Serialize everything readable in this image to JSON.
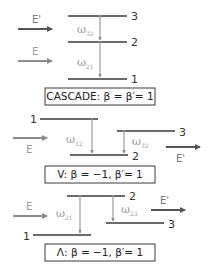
{
  "colors": {
    "level_line": "#3a3a3a",
    "beam_dark": "#555555",
    "beam_light": "#8c8c8c",
    "transition": "#8a8a8a",
    "label_gray": "#9a9a9a",
    "text": "#222222"
  },
  "diagrams": [
    {
      "name": "cascade",
      "levels": [
        "3",
        "2",
        "1"
      ],
      "fields": {
        "e_prime": "E'",
        "e": "E"
      },
      "transitions": [
        {
          "symbol": "ω",
          "subscript": "32"
        },
        {
          "symbol": "ω",
          "subscript": "21"
        }
      ],
      "caption": "CASCADE: β = β′= 1"
    },
    {
      "name": "v",
      "levels": [
        "1",
        "3",
        "2"
      ],
      "fields": {
        "e": "E",
        "e_prime": "E'"
      },
      "transitions": [
        {
          "symbol": "ω",
          "subscript": "12"
        },
        {
          "symbol": "ω",
          "subscript": "32"
        }
      ],
      "caption": "V: β = −1, β′= 1"
    },
    {
      "name": "lambda",
      "levels": [
        "2",
        "3",
        "1"
      ],
      "fields": {
        "e": "E",
        "e_prime": "E'"
      },
      "transitions": [
        {
          "symbol": "ω",
          "subscript": "21"
        },
        {
          "symbol": "ω",
          "subscript": "23"
        }
      ],
      "caption": "Λ: β = −1, β′= 1"
    }
  ]
}
